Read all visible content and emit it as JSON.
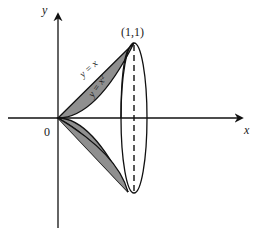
{
  "figure": {
    "axis_x_label": "x",
    "axis_y_label": "y",
    "origin_label": "0",
    "point_label": "(1,1)",
    "curve_upper_label": "y = x",
    "curve_lower_label": "y = x²",
    "fill_color": "#8f8f8f",
    "line_color": "#111111"
  }
}
